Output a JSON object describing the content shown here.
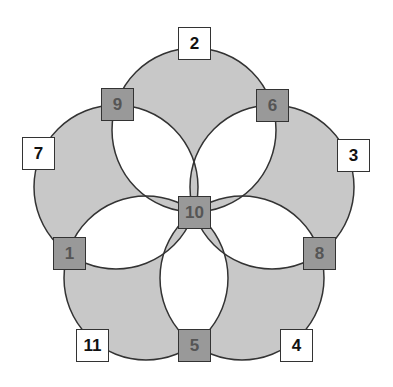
{
  "diagram": {
    "colors": {
      "petal_fill": "#c8c8c8",
      "overlap_fill": "#ffffff",
      "stroke": "#333333",
      "inner_node_fill": "#999999",
      "outer_node_fill": "#ffffff"
    },
    "circles": [
      {
        "cx": 194,
        "cy": 130,
        "r": 82
      },
      {
        "cx": 272,
        "cy": 187,
        "r": 82
      },
      {
        "cx": 242,
        "cy": 278,
        "r": 82
      },
      {
        "cx": 146,
        "cy": 278,
        "r": 82
      },
      {
        "cx": 116,
        "cy": 187,
        "r": 82
      }
    ],
    "nodes": [
      {
        "label": "10",
        "type": "inner",
        "x": 178,
        "y": 196
      },
      {
        "label": "9",
        "type": "inner",
        "x": 101,
        "y": 88
      },
      {
        "label": "6",
        "type": "inner",
        "x": 256,
        "y": 89
      },
      {
        "label": "1",
        "type": "inner",
        "x": 53,
        "y": 237
      },
      {
        "label": "8",
        "type": "inner",
        "x": 303,
        "y": 237
      },
      {
        "label": "5",
        "type": "inner",
        "x": 178,
        "y": 329
      },
      {
        "label": "2",
        "type": "outer",
        "x": 178,
        "y": 27
      },
      {
        "label": "7",
        "type": "outer",
        "x": 22,
        "y": 137
      },
      {
        "label": "3",
        "type": "outer",
        "x": 337,
        "y": 139
      },
      {
        "label": "11",
        "type": "outer",
        "x": 76,
        "y": 329
      },
      {
        "label": "4",
        "type": "outer",
        "x": 280,
        "y": 329
      }
    ]
  }
}
